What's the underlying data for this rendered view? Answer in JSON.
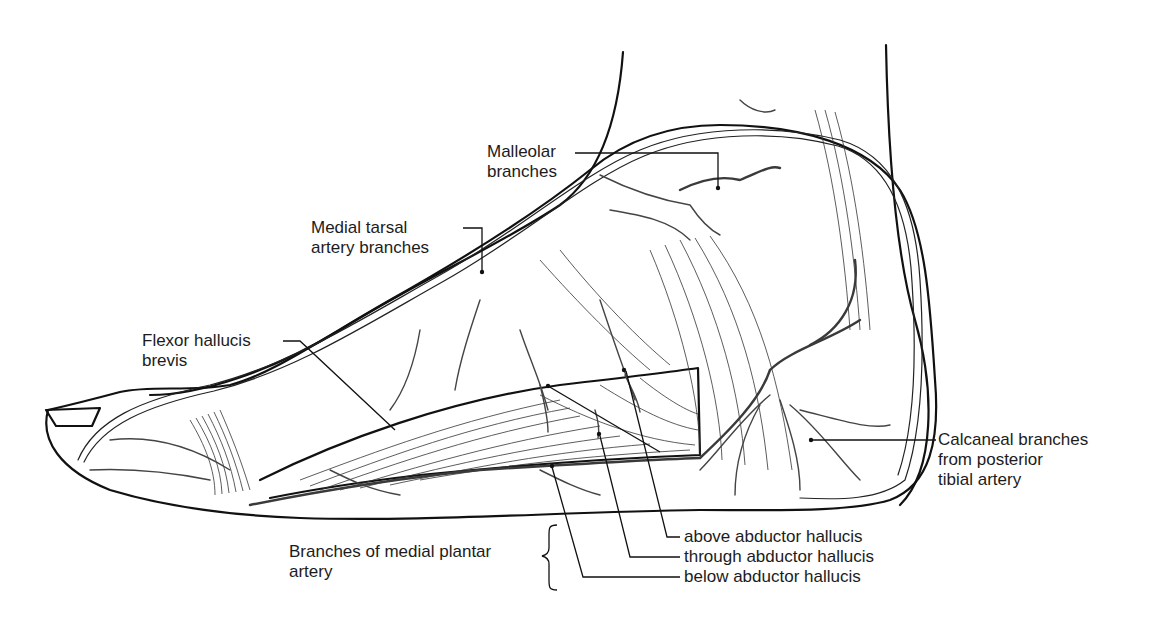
{
  "figure": {
    "labels": {
      "malleolar": {
        "line1": "Malleolar",
        "line2": "branches"
      },
      "medial_tarsal": {
        "line1": "Medial tarsal",
        "line2": "artery branches"
      },
      "flexor_hallucis": {
        "line1": "Flexor hallucis",
        "line2": "brevis"
      },
      "calcaneal": {
        "line1": "Calcaneal branches",
        "line2": "from posterior",
        "line3": "tibial artery"
      },
      "medial_plantar": {
        "line1": "Branches of medial plantar",
        "line2": "artery"
      },
      "above": "above abductor hallucis",
      "through": "through abductor hallucis",
      "below": "below abductor hallucis"
    },
    "colors": {
      "ink": "#111111",
      "vessel": "#3a3a3a",
      "background": "#ffffff"
    }
  }
}
